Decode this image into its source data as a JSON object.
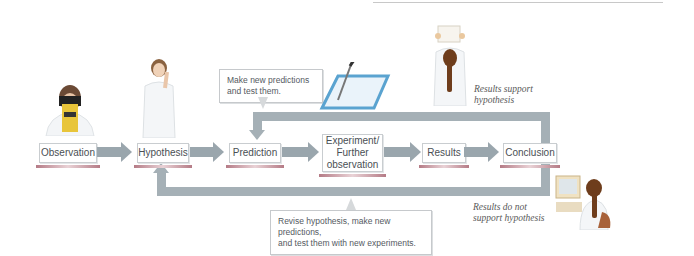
{
  "diagram": {
    "steps": [
      {
        "id": "observation",
        "label": "Observation"
      },
      {
        "id": "hypothesis",
        "label": "Hypothesis"
      },
      {
        "id": "prediction",
        "label": "Prediction"
      },
      {
        "id": "experiment",
        "label": "Experiment/ Further observation",
        "line1": "Experiment/",
        "line2": "Further",
        "line3": "observation"
      },
      {
        "id": "results",
        "label": "Results"
      },
      {
        "id": "conclusion",
        "label": "Conclusion"
      }
    ],
    "callouts": {
      "top": {
        "line1": "Make new predictions",
        "line2": "and test them."
      },
      "bottom": {
        "line1": "Revise hypothesis, make new predictions,",
        "line2": "and test them with new experiments."
      }
    },
    "outcomes": {
      "support": {
        "line1": "Results support",
        "line2": "hypothesis"
      },
      "not_support": {
        "line1": "Results do not",
        "line2": "support hypothesis"
      }
    },
    "icons": [
      "scientist-microscope-icon",
      "scientist-thinking-icon",
      "pipette-tray-icon",
      "scientist-holding-results-icon",
      "scientist-computer-icon"
    ],
    "colors": {
      "arrow": "#9aa6ad",
      "underline": "#b57b86",
      "box_border": "#c9cdd0",
      "text": "#4a4f54"
    }
  }
}
